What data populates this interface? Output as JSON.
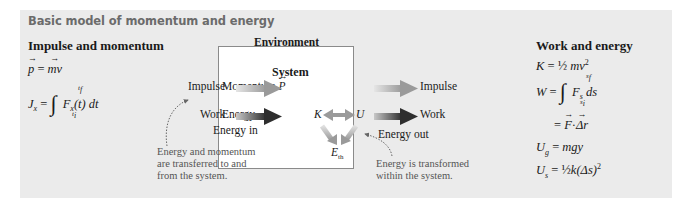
{
  "title": "Basic model of momentum and energy",
  "left": {
    "heading": "Impulse and momentum",
    "eq1": {
      "lhs": "p",
      "rhs": "mv"
    },
    "eq2": {
      "lhs": "J",
      "lhs_sub": "x",
      "upper": "t",
      "upper_sub": "f",
      "lower": "t",
      "lower_sub": "i",
      "integrand": "F",
      "integrand_sub": "x",
      "rest": "(t) dt"
    }
  },
  "center": {
    "environment_label": "Environment",
    "system_label": "System",
    "momentum_label": "Momentum",
    "momentum_symbol": "P",
    "energy_label": "Energy",
    "K": "K",
    "U": "U",
    "Eth": "E",
    "Eth_sub": "th",
    "in_impulse": "Impulse",
    "in_work": "Work",
    "energy_in": "Energy in",
    "out_impulse": "Impulse",
    "out_work": "Work",
    "energy_out": "Energy out",
    "note_left": [
      "Energy and momentum",
      "are transferred to and",
      "from the system."
    ],
    "note_right": [
      "Energy is transformed",
      "within the system."
    ]
  },
  "right": {
    "heading": "Work and energy",
    "eq_K": {
      "lhs": "K",
      "frac": "½",
      "rhs": "mv",
      "sup": "2"
    },
    "eq_W": {
      "lhs": "W",
      "upper": "s",
      "upper_sub": "f",
      "lower": "s",
      "lower_sub": "i",
      "integrand": "F",
      "integrand_sub": "s",
      "rest": "ds"
    },
    "eq_W2": {
      "F": "F",
      "dot": "·",
      "dr": "Δr"
    },
    "eq_Ug": {
      "lhs": "U",
      "lhs_sub": "g",
      "rhs": "mgy"
    },
    "eq_Us": {
      "lhs": "U",
      "lhs_sub": "s",
      "frac": "½",
      "rhs": "k(Δs)",
      "sup": "2"
    }
  },
  "colors": {
    "panel": "#ebebeb",
    "impulse_arrow": "#9a9a9a",
    "work_arrow": "#3a3a3a",
    "title": "#6b6b6b"
  }
}
